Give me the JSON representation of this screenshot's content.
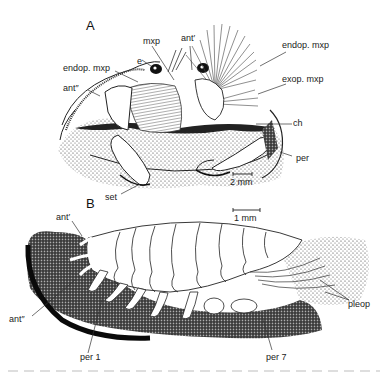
{
  "figure": {
    "panels": [
      {
        "id": "A",
        "letter": "A",
        "scale_bar": "2 mm",
        "labels": {
          "mxp": "mxp",
          "ant_prime": "ant′",
          "e": "e",
          "endop_mxp_left": "endop. mxp",
          "ant_double_prime": "ant″",
          "endop_mxp_right": "endop. mxp",
          "exop_mxp": "exop. mxp",
          "ch": "ch",
          "per": "per",
          "set": "set"
        }
      },
      {
        "id": "B",
        "letter": "B",
        "scale_bar": "1 mm",
        "labels": {
          "ant_prime": "ant′",
          "ant_double_prime": "ant″",
          "per1": "per 1",
          "per7": "per 7",
          "pleop": "pleop"
        }
      }
    ],
    "colors": {
      "ink": "#1a1a1a",
      "background": "#ffffff",
      "stipple": "#333333"
    }
  }
}
